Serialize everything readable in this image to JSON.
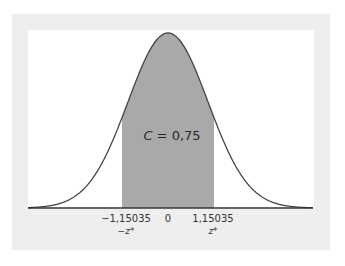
{
  "diagram": {
    "type": "normal-distribution-confidence-interval",
    "area_label": {
      "variable": "C",
      "equals": " = ",
      "value": "0,75"
    },
    "ticks": [
      {
        "value": "−1,15035",
        "sublabel": "−z*"
      },
      {
        "value": "0",
        "sublabel": ""
      },
      {
        "value": "1,15035",
        "sublabel": "z*"
      }
    ],
    "z_star": 1.15035,
    "confidence": 0.75,
    "colors": {
      "frame": "#eeeeee",
      "panel": "#ffffff",
      "shade": "#a9a9a9",
      "curve": "#444444",
      "axis": "#333333"
    }
  }
}
